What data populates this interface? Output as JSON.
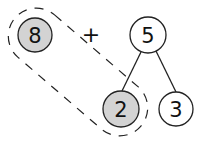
{
  "diagram": {
    "type": "number-bond",
    "operator": {
      "label": "+",
      "x": 91,
      "y": 34
    },
    "nodes": [
      {
        "id": "addend",
        "label": "8",
        "cx": 35,
        "cy": 35,
        "r": 17,
        "highlighted": true
      },
      {
        "id": "whole",
        "label": "5",
        "cx": 148,
        "cy": 35,
        "r": 18,
        "highlighted": false
      },
      {
        "id": "part-left",
        "label": "2",
        "cx": 121,
        "cy": 109,
        "r": 18,
        "highlighted": true
      },
      {
        "id": "part-right",
        "label": "3",
        "cx": 176,
        "cy": 109,
        "r": 17,
        "highlighted": false
      }
    ],
    "edges": [
      {
        "from": "whole",
        "to": "part-left"
      },
      {
        "from": "whole",
        "to": "part-right"
      }
    ],
    "grouping": {
      "style": "dashed-loop",
      "encloses": [
        "addend",
        "part-left"
      ]
    },
    "colors": {
      "highlight_fill": "#d3d3d3",
      "node_fill": "#ffffff",
      "stroke": "#222222",
      "background": "#ffffff"
    }
  }
}
